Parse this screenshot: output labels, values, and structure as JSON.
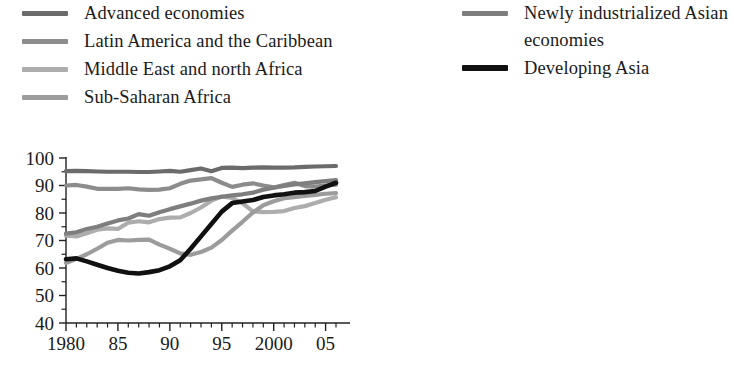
{
  "legend": {
    "left_column": [
      {
        "label": "Advanced economies",
        "color": "#6b6b6b",
        "swatch": "legend-line-advanced-economies"
      },
      {
        "label": "Latin America and the Caribbean",
        "color": "#8c8c8c",
        "swatch": "legend-line-latin-america"
      },
      {
        "label": "Middle East and north Africa",
        "color": "#adadad",
        "swatch": "legend-line-middle-east"
      },
      {
        "label": "Sub-Saharan Africa",
        "color": "#9c9c9c",
        "swatch": "legend-line-sub-saharan-africa"
      }
    ],
    "right_column": [
      {
        "label": "Newly industrialized Asian\neconomies",
        "color": "#7e7e7e",
        "swatch": "legend-line-newly-industrialized-asia"
      },
      {
        "label": "Developing Asia",
        "color": "#111111",
        "swatch": "legend-line-developing-asia"
      }
    ]
  },
  "chart_data": {
    "type": "line",
    "title": "",
    "subtitle": "",
    "xlabel": "",
    "ylabel": "",
    "xlim": [
      1980,
      2006
    ],
    "ylim": [
      40,
      100
    ],
    "grid": false,
    "legend_position": "top",
    "y_ticks": [
      40,
      50,
      60,
      70,
      80,
      90,
      100
    ],
    "y_tick_labels": [
      "40",
      "50",
      "60",
      "70",
      "80",
      "90",
      "100"
    ],
    "y_minor_ticks": [
      45,
      55,
      65,
      75,
      85,
      95
    ],
    "x_ticks": [
      1980,
      1985,
      1990,
      1995,
      2000,
      2005
    ],
    "x_tick_labels": [
      "1980",
      "85",
      "90",
      "95",
      "2000",
      "05"
    ],
    "x_minor_ticks": [
      1981,
      1982,
      1983,
      1984,
      1986,
      1987,
      1988,
      1989,
      1991,
      1992,
      1993,
      1994,
      1996,
      1997,
      1998,
      1999,
      2001,
      2002,
      2003,
      2004,
      2006
    ],
    "x": [
      1980,
      1981,
      1982,
      1983,
      1984,
      1985,
      1986,
      1987,
      1988,
      1989,
      1990,
      1991,
      1992,
      1993,
      1994,
      1995,
      1996,
      1997,
      1998,
      1999,
      2000,
      2001,
      2002,
      2003,
      2004,
      2005,
      2006
    ],
    "series": [
      {
        "name": "Advanced economies",
        "color": "#6b6b6b",
        "width": 4.2,
        "values": [
          95.2,
          95.3,
          95.2,
          95.1,
          95.0,
          95.0,
          95.0,
          94.9,
          94.9,
          95.1,
          95.3,
          95.0,
          95.6,
          96.2,
          95.2,
          96.4,
          96.5,
          96.3,
          96.5,
          96.6,
          96.5,
          96.5,
          96.6,
          96.8,
          96.9,
          97.0,
          97.1
        ]
      },
      {
        "name": "Latin America and the Caribbean",
        "color": "#8c8c8c",
        "width": 4.2,
        "values": [
          90.0,
          90.2,
          89.6,
          88.8,
          88.8,
          88.8,
          89.0,
          88.6,
          88.4,
          88.5,
          89.0,
          90.6,
          91.8,
          92.2,
          92.7,
          91.0,
          89.5,
          90.3,
          90.8,
          90.0,
          89.3,
          90.2,
          91.0,
          89.8,
          89.6,
          90.0,
          90.3
        ]
      },
      {
        "name": "Middle East and north Africa",
        "color": "#adadad",
        "width": 4.2,
        "values": [
          71.8,
          71.5,
          72.6,
          73.9,
          74.4,
          74.2,
          76.5,
          77.0,
          76.6,
          77.8,
          78.3,
          78.4,
          80.0,
          82.0,
          84.5,
          86.0,
          85.5,
          83.5,
          80.6,
          80.3,
          80.4,
          80.7,
          81.8,
          82.5,
          83.6,
          84.8,
          85.7
        ]
      },
      {
        "name": "Sub-Saharan Africa",
        "color": "#9c9c9c",
        "width": 4.2,
        "values": [
          61.8,
          63.3,
          65.0,
          67.0,
          69.2,
          70.2,
          70.0,
          70.2,
          70.3,
          68.5,
          67.0,
          65.3,
          64.8,
          65.8,
          67.4,
          70.2,
          73.6,
          76.8,
          80.2,
          82.8,
          84.3,
          85.4,
          85.8,
          86.2,
          86.6,
          87.0,
          87.2
        ]
      },
      {
        "name": "Newly industrialized Asian economies",
        "color": "#7e7e7e",
        "width": 4.2,
        "values": [
          72.5,
          73.0,
          74.2,
          75.0,
          76.2,
          77.3,
          78.0,
          79.6,
          79.0,
          80.3,
          81.4,
          82.4,
          83.4,
          84.5,
          85.3,
          85.9,
          86.4,
          86.8,
          87.4,
          88.5,
          89.2,
          89.8,
          90.4,
          90.8,
          91.2,
          91.6,
          92.0
        ]
      },
      {
        "name": "Developing Asia",
        "color": "#111111",
        "width": 4.6,
        "values": [
          63.2,
          63.5,
          62.4,
          61.2,
          60.0,
          59.0,
          58.3,
          58.0,
          58.5,
          59.2,
          60.6,
          62.8,
          67.0,
          71.5,
          76.0,
          80.5,
          83.6,
          84.2,
          84.7,
          85.8,
          86.4,
          86.8,
          87.4,
          87.6,
          88.0,
          89.6,
          91.0
        ]
      }
    ]
  }
}
